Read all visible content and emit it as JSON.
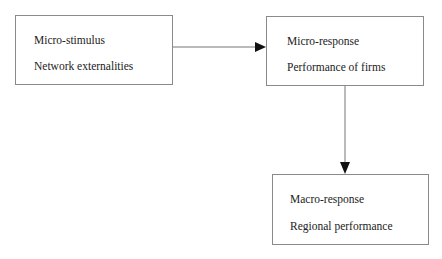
{
  "diagram": {
    "nodes": [
      {
        "id": "micro-stimulus",
        "title": "Micro-stimulus",
        "subtitle": "Network externalities"
      },
      {
        "id": "micro-response",
        "title": "Micro-response",
        "subtitle": "Performance of firms"
      },
      {
        "id": "macro-response",
        "title": "Macro-response",
        "subtitle": "Regional performance"
      }
    ],
    "edges": [
      {
        "from": "micro-stimulus",
        "to": "micro-response"
      },
      {
        "from": "micro-response",
        "to": "macro-response"
      }
    ]
  }
}
